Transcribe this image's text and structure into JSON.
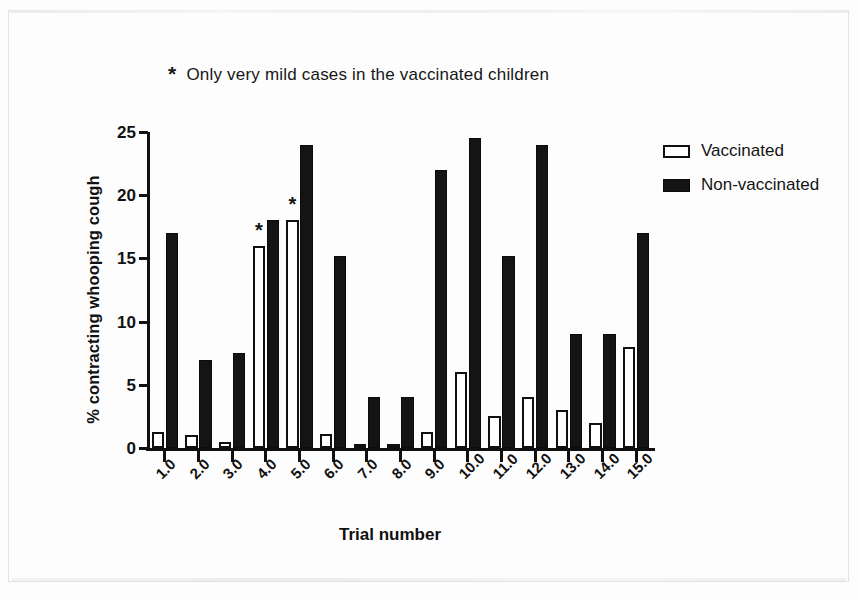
{
  "figure": {
    "annotation_star": "*",
    "annotation_text": "Only very mild cases in the vaccinated children",
    "background_color": "#fdfdfd",
    "ink_color": "#111111"
  },
  "legend": {
    "position": "top-right",
    "entries": [
      {
        "label": "Vaccinated",
        "swatch": "open-rectangle",
        "color": "#ffffff"
      },
      {
        "label": "Non-vaccinated",
        "swatch": "solid-rectangle",
        "color": "#141414"
      }
    ]
  },
  "chart_data": {
    "type": "bar",
    "title": "",
    "subtitle": "",
    "annotation": "* Only very mild cases in the vaccinated children",
    "xlabel": "Trial number",
    "ylabel": "% contracting whooping cough",
    "ylim": [
      0,
      25
    ],
    "yticks": [
      0,
      5,
      10,
      15,
      20,
      25
    ],
    "ytick_labels": [
      "0",
      "5",
      "10",
      "15",
      "20",
      "25"
    ],
    "grid": false,
    "legend_position": "top-right",
    "categories": [
      "1.0",
      "2.0",
      "3.0",
      "4.0",
      "5.0",
      "6.0",
      "7.0",
      "8.0",
      "9.0",
      "10.0",
      "11.0",
      "12.0",
      "13.0",
      "14.0",
      "15.0"
    ],
    "series": [
      {
        "name": "Vaccinated",
        "fill": "#ffffff",
        "edge": "#101010",
        "values": [
          1.3,
          1.0,
          0.5,
          16.0,
          18.0,
          1.1,
          0.2,
          0.2,
          1.3,
          6.0,
          2.5,
          4.0,
          3.0,
          2.0,
          8.0
        ]
      },
      {
        "name": "Non-vaccinated",
        "fill": "#141414",
        "edge": "#0b0b0b",
        "values": [
          17.0,
          7.0,
          7.5,
          18.0,
          24.0,
          15.2,
          4.0,
          4.0,
          22.0,
          24.5,
          15.2,
          24.0,
          9.0,
          9.0,
          17.0
        ]
      }
    ],
    "point_annotations": [
      {
        "category": "4.0",
        "series": "Vaccinated",
        "text": "*"
      },
      {
        "category": "5.0",
        "series": "Vaccinated",
        "text": "*"
      }
    ]
  }
}
